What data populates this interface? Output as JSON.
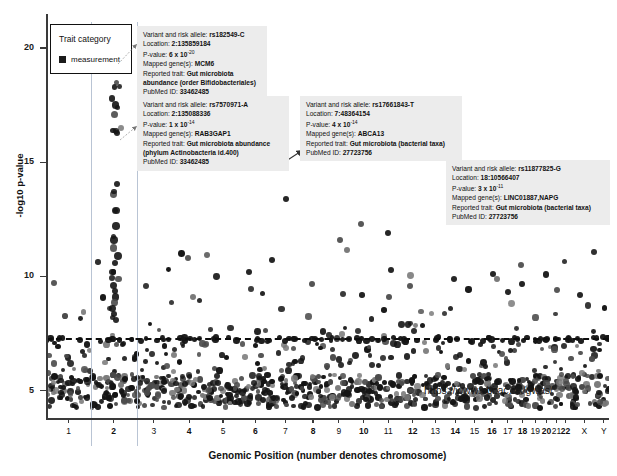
{
  "chart_data": {
    "type": "scatter",
    "title": "",
    "xlabel": "Genomic Position (number denotes chromosome)",
    "ylabel": "-log10 p-value",
    "ylim": [
      3.8,
      21.5
    ],
    "yticks": [
      5,
      10,
      15,
      20
    ],
    "grid": false,
    "legend_position": "top-left",
    "source_url": "https://www.ebi.ac.uk/gwas/",
    "significance_threshold": 7.3,
    "chromosomes": [
      "1",
      "2",
      "3",
      "4",
      "5",
      "6",
      "7",
      "8",
      "9",
      "10",
      "11",
      "12",
      "13",
      "14",
      "15",
      "16",
      "17",
      "18",
      "19",
      "20",
      "21",
      "22",
      "X",
      "Y"
    ],
    "series": [
      {
        "name": "measurement",
        "color": "#1b1b1b",
        "description": "GWAS associations for gut microbiota traits plotted by genomic position"
      }
    ],
    "highlighted_variants": [
      {
        "rsid": "rs182549-C",
        "chromosome": "2",
        "neg_log10_p": 19.2
      },
      {
        "rsid": "rs7570971-A",
        "chromosome": "2",
        "neg_log10_p": 14.0
      },
      {
        "rsid": "rs17661843-T",
        "chromosome": "7",
        "neg_log10_p": 13.4
      },
      {
        "rsid": "rs11877825-G",
        "chromosome": "18",
        "neg_log10_p": 10.5
      }
    ]
  },
  "axes": {
    "y_title": "-log10 p-value",
    "x_title": "Genomic Position (number denotes chromosome)",
    "y_ticks": [
      "20",
      "15",
      "10",
      "5"
    ],
    "x_ticks": [
      "1",
      "2",
      "3",
      "4",
      "5",
      "6",
      "7",
      "8",
      "9",
      "10",
      "11",
      "12",
      "13",
      "14",
      "15",
      "16",
      "17",
      "18",
      "19",
      "20",
      "21",
      "22",
      "X",
      "Y"
    ]
  },
  "legend": {
    "title": "Trait category",
    "items": [
      {
        "label": "measurement",
        "color": "#1b1b1b"
      }
    ]
  },
  "callouts": [
    {
      "id": "callout-1",
      "variant_label": "Variant and risk allele:",
      "variant_value": "rs182549-C",
      "location_label": "Location:",
      "location_value": "2:135859184",
      "pvalue_label": "P-value:",
      "pvalue_value": "6 x 10",
      "pvalue_exp": "-20",
      "gene_label": "Mapped gene(s):",
      "gene_value": "MCM6",
      "trait_label": "Reported trait:",
      "trait_value": "Gut microbiota abundance (order Bifidobacteriales)",
      "pubmed_label": "PubMed ID:",
      "pubmed_value": "33462485"
    },
    {
      "id": "callout-2",
      "variant_label": "Variant and risk allele:",
      "variant_value": "rs7570971-A",
      "location_label": "Location:",
      "location_value": "2:135088336",
      "pvalue_label": "P-value:",
      "pvalue_value": "1 x 10",
      "pvalue_exp": "-14",
      "gene_label": "Mapped gene(s):",
      "gene_value": "RAB3GAP1",
      "trait_label": "Reported trait:",
      "trait_value": "Gut microbiota abundance (phylum Actinobacteria id.400)",
      "pubmed_label": "PubMed ID:",
      "pubmed_value": "33462485"
    },
    {
      "id": "callout-3",
      "variant_label": "Variant and risk allele:",
      "variant_value": "rs17661843-T",
      "location_label": "Location:",
      "location_value": "7:48364154",
      "pvalue_label": "P-value:",
      "pvalue_value": "4 x 10",
      "pvalue_exp": "-14",
      "gene_label": "Mapped gene(s):",
      "gene_value": "ABCA13",
      "trait_label": "Reported trait:",
      "trait_value": "Gut microbiota (bacterial taxa)",
      "pubmed_label": "PubMed ID:",
      "pubmed_value": "27723756"
    },
    {
      "id": "callout-4",
      "variant_label": "Variant and risk allele:",
      "variant_value": "rs11877825-G",
      "location_label": "Location:",
      "location_value": "18:10566407",
      "pvalue_label": "P-value:",
      "pvalue_value": "3 x 10",
      "pvalue_exp": "-11",
      "gene_label": "Mapped gene(s):",
      "gene_value": "LINC01887,NAPG",
      "trait_label": "Reported trait:",
      "trait_value": "Gut microbiota (bacterial taxa)",
      "pubmed_label": "PubMed ID:",
      "pubmed_value": "27723756"
    }
  ],
  "footer": {
    "url": "https://www.ebi.ac.uk/gwas/"
  }
}
